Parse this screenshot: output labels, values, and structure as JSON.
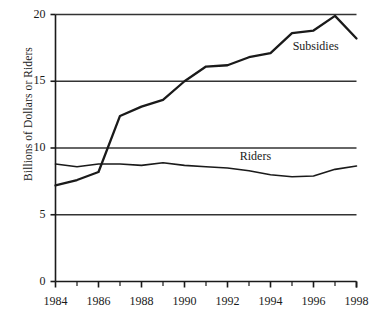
{
  "chart_data": {
    "type": "line",
    "title": "",
    "xlabel": "",
    "ylabel": "Billions of Dollars or Riders",
    "xlim": [
      1984,
      1998
    ],
    "ylim": [
      0,
      20
    ],
    "grid": "horizontal",
    "legend_position": "inline-labels",
    "x": [
      1984,
      1985,
      1986,
      1987,
      1988,
      1989,
      1990,
      1991,
      1992,
      1993,
      1994,
      1995,
      1996,
      1997,
      1998
    ],
    "xtick_labels": [
      "1984",
      "1986",
      "1988",
      "1990",
      "1992",
      "1994",
      "1996",
      "1998"
    ],
    "xtick_values": [
      1984,
      1986,
      1988,
      1990,
      1992,
      1994,
      1996,
      1998
    ],
    "xminor_ticks": [
      1985,
      1987,
      1989,
      1991,
      1993,
      1995,
      1997
    ],
    "ytick_labels": [
      "0",
      "5",
      "10",
      "15",
      "20"
    ],
    "ytick_values": [
      0,
      5,
      10,
      15,
      20
    ],
    "series": [
      {
        "name": "Subsidies",
        "label": "Subsidies",
        "color": "#1a1a1a",
        "values": [
          7.2,
          7.6,
          8.2,
          12.4,
          13.1,
          13.6,
          15.0,
          16.1,
          16.2,
          16.8,
          17.1,
          18.6,
          18.8,
          19.9,
          18.2
        ]
      },
      {
        "name": "Riders",
        "label": "Riders",
        "color": "#1a1a1a",
        "values": [
          8.8,
          8.6,
          8.8,
          8.8,
          8.7,
          8.9,
          8.7,
          8.6,
          8.5,
          8.3,
          8.0,
          7.85,
          7.9,
          8.4,
          8.65
        ]
      }
    ],
    "annotations": [
      {
        "text": "Subsidies",
        "x": 1996.1,
        "y": 17.55
      },
      {
        "text": "Riders",
        "x": 1993.3,
        "y": 9.35
      }
    ]
  },
  "style": {
    "axis_color": "#1a1a1a",
    "grid_color": "#333333",
    "background": "#ffffff"
  }
}
